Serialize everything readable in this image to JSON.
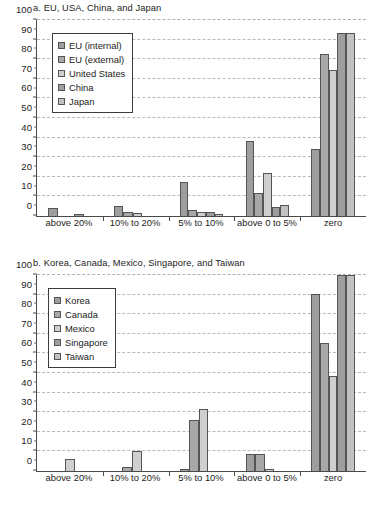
{
  "chart_data": [
    {
      "type": "bar",
      "title": "a. EU, USA, China, and Japan",
      "xlabel": "",
      "ylabel": "",
      "ylim": [
        0,
        100
      ],
      "yticks": [
        0,
        10,
        20,
        30,
        40,
        50,
        60,
        70,
        80,
        90,
        100
      ],
      "grid": true,
      "legend_position": "top-left",
      "categories": [
        "above 20%",
        "10% to 20%",
        "5% to 10%",
        "above 0 to 5%",
        "zero"
      ],
      "series": [
        {
          "name": "EU (internal)",
          "color": "#9e9e9e",
          "values": [
            4,
            5.1,
            17.1,
            38.2,
            34.3
          ]
        },
        {
          "name": "EU (external)",
          "color": "#a8a8a8",
          "values": [
            0,
            2,
            3.3,
            11.5,
            82.5
          ]
        },
        {
          "name": "United States",
          "color": "#cfcfcf",
          "values": [
            0,
            1.3,
            2.2,
            22.2,
            74.5
          ]
        },
        {
          "name": "China",
          "color": "#9e9e9e",
          "values": [
            1.1,
            0,
            2.2,
            4.4,
            93.5
          ]
        },
        {
          "name": "Japan",
          "color": "#c2c2c2",
          "values": [
            0,
            0,
            1.2,
            5.4,
            93.5
          ]
        }
      ]
    },
    {
      "type": "bar",
      "title": "b. Korea, Canada, Mexico, Singapore, and Taiwan",
      "xlabel": "",
      "ylabel": "",
      "ylim": [
        0,
        100
      ],
      "yticks": [
        0,
        10,
        20,
        30,
        40,
        50,
        60,
        70,
        80,
        90,
        100
      ],
      "grid": true,
      "legend_position": "top-left",
      "categories": [
        "above 20%",
        "10% to 20%",
        "5% to 10%",
        "above 0 to 5%",
        "zero"
      ],
      "series": [
        {
          "name": "Korea",
          "color": "#9e9e9e",
          "values": [
            0,
            0,
            1.1,
            8.5,
            90.5
          ]
        },
        {
          "name": "Canada",
          "color": "#a8a8a8",
          "values": [
            0,
            2.1,
            26.2,
            8.5,
            65.5
          ]
        },
        {
          "name": "Mexico",
          "color": "#cfcfcf",
          "values": [
            6.2,
            10.3,
            31.4,
            1.1,
            48.6
          ]
        },
        {
          "name": "Singapore",
          "color": "#9e9e9e",
          "values": [
            0,
            0,
            0,
            0,
            100
          ]
        },
        {
          "name": "Taiwan",
          "color": "#c2c2c2",
          "values": [
            0,
            0,
            0,
            0,
            100
          ]
        }
      ]
    }
  ]
}
